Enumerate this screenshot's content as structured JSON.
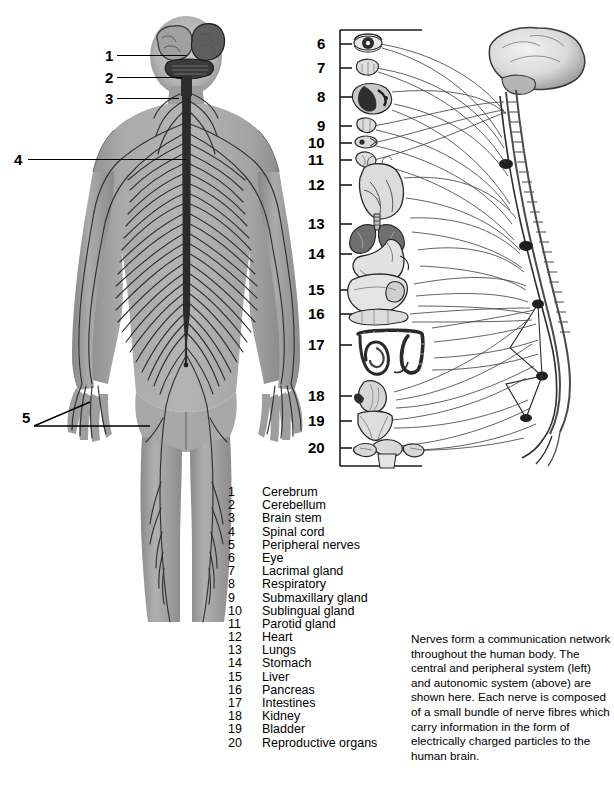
{
  "figures": {
    "left": {
      "name": "central-and-peripheral-nervous-system-posterior-view",
      "callouts": [
        {
          "num": "1",
          "target": "cerebrum"
        },
        {
          "num": "2",
          "target": "cerebellum"
        },
        {
          "num": "3",
          "target": "brain-stem"
        },
        {
          "num": "4",
          "target": "spinal-cord"
        },
        {
          "num": "5",
          "target": "peripheral-nerves"
        }
      ]
    },
    "right": {
      "name": "autonomic-nervous-system-with-target-organs",
      "callouts": [
        {
          "num": "6",
          "target": "eye"
        },
        {
          "num": "7",
          "target": "lacrimal-gland"
        },
        {
          "num": "8",
          "target": "respiratory"
        },
        {
          "num": "9",
          "target": "submaxillary-gland"
        },
        {
          "num": "10",
          "target": "sublingual-gland"
        },
        {
          "num": "11",
          "target": "parotid-gland"
        },
        {
          "num": "12",
          "target": "heart"
        },
        {
          "num": "13",
          "target": "lungs"
        },
        {
          "num": "14",
          "target": "stomach"
        },
        {
          "num": "15",
          "target": "liver"
        },
        {
          "num": "16",
          "target": "pancreas"
        },
        {
          "num": "17",
          "target": "intestines"
        },
        {
          "num": "18",
          "target": "kidney"
        },
        {
          "num": "19",
          "target": "bladder"
        },
        {
          "num": "20",
          "target": "reproductive-organs"
        }
      ]
    }
  },
  "legend": {
    "items": [
      {
        "num": "1",
        "label": "Cerebrum"
      },
      {
        "num": "2",
        "label": "Cerebellum"
      },
      {
        "num": "3",
        "label": "Brain stem"
      },
      {
        "num": "4",
        "label": "Spinal cord"
      },
      {
        "num": "5",
        "label": "Peripheral nerves"
      },
      {
        "num": "6",
        "label": "Eye"
      },
      {
        "num": "7",
        "label": "Lacrimal gland"
      },
      {
        "num": "8",
        "label": "Respiratory"
      },
      {
        "num": "9",
        "label": "Submaxillary gland"
      },
      {
        "num": "10",
        "label": "Sublingual gland"
      },
      {
        "num": "11",
        "label": "Parotid gland"
      },
      {
        "num": "12",
        "label": "Heart"
      },
      {
        "num": "13",
        "label": "Lungs"
      },
      {
        "num": "14",
        "label": "Stomach"
      },
      {
        "num": "15",
        "label": "Liver"
      },
      {
        "num": "16",
        "label": "Pancreas"
      },
      {
        "num": "17",
        "label": "Intestines"
      },
      {
        "num": "18",
        "label": "Kidney"
      },
      {
        "num": "19",
        "label": "Bladder"
      },
      {
        "num": "20",
        "label": "Reproductive organs"
      }
    ]
  },
  "caption": {
    "text": "Nerves form a communication network throughout the human body. The central and peripheral system (left) and autonomic system (above) are shown here. Each nerve is composed of a small bundle of nerve fibres which carry information in the form of electrically charged particles to the human brain."
  },
  "colors": {
    "background": "#ffffff",
    "ink": "#000000",
    "body_fill": "#9a9a9a",
    "body_fill_light": "#b9b9b9",
    "body_fill_dark": "#6f6f6f",
    "nerve_line": "#3a3a3a",
    "organ_outline": "#4a4a4a",
    "organ_fill": "#d8d8d8"
  }
}
